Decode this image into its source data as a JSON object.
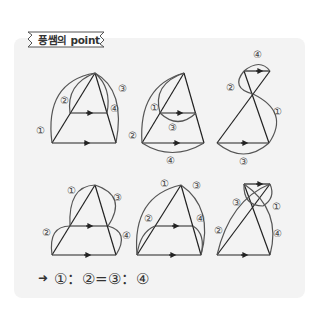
{
  "header": {
    "ribbon_label": "풍쌤의 point"
  },
  "diagrams": {
    "row1": [
      {
        "labels": [
          "①",
          "②",
          "③",
          "④"
        ]
      },
      {
        "labels": [
          "①",
          "②",
          "③",
          "④"
        ]
      },
      {
        "labels": [
          "①",
          "②",
          "③",
          "④"
        ]
      }
    ],
    "row2": [
      {
        "labels": [
          "①",
          "②",
          "③",
          "④"
        ]
      },
      {
        "labels": [
          "①",
          "②",
          "③",
          "④"
        ]
      },
      {
        "labels": [
          "①",
          "②",
          "③",
          "④"
        ]
      }
    ]
  },
  "formula": {
    "arrow": "➜",
    "text": "①：②=③：④"
  },
  "colors": {
    "panel_bg": "#f3f3f3",
    "line": "#222222",
    "arc": "#555555",
    "label": "#444444"
  }
}
